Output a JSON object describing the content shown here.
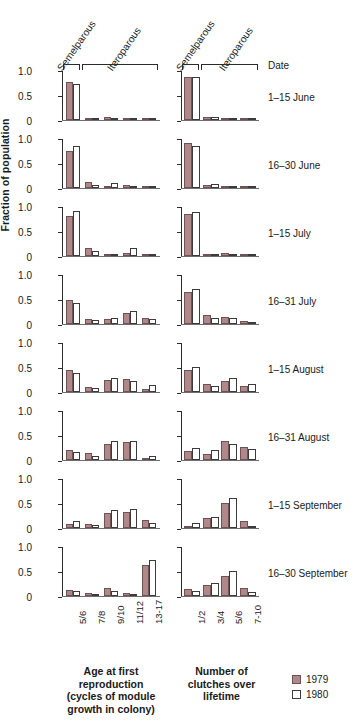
{
  "chart_data": {
    "type": "bar",
    "title": "",
    "ylabel": "Fraction of population",
    "ylim": [
      0,
      1.0
    ],
    "ytick_labels": [
      "1.0",
      "0.5",
      "0"
    ],
    "ytick_values": [
      1.0,
      0.5,
      0
    ],
    "grid": false,
    "legend_position": "bottom-right",
    "legend": [
      {
        "name": "1979",
        "color": "#b0888a",
        "fill": "solid"
      },
      {
        "name": "1980",
        "color": "#ffffff",
        "fill": "open"
      }
    ],
    "series_names": [
      "1979",
      "1980"
    ],
    "row_header_label": "Date",
    "group_brackets": [
      "Semelparous",
      "Iteroparous"
    ],
    "panels": [
      {
        "xlabel": "Age at first reproduction (cycles of module growth in colony)",
        "xlabel_lines": [
          "Age at first",
          "reproduction",
          "(cycles of module",
          "growth in colony)"
        ],
        "categories": [
          "5/6",
          "7/8",
          "9/10",
          "11/12",
          "13-17"
        ],
        "bracket_split": 1
      },
      {
        "xlabel": "Number of clutches over lifetime",
        "xlabel_lines": [
          "Number of",
          "clutches over",
          "lifetime"
        ],
        "categories": [
          "1/2",
          "3/4",
          "5/6",
          "7-10"
        ],
        "bracket_split": 1
      }
    ],
    "rows": [
      {
        "date": "1–15 June",
        "left": {
          "1979": [
            0.76,
            0.05,
            0.06,
            0.05,
            0.02
          ],
          "1980": [
            0.73,
            0.05,
            0.04,
            0.03,
            0.04
          ]
        },
        "right": {
          "1979": [
            0.87,
            0.07,
            0.04,
            0.03
          ],
          "1980": [
            0.87,
            0.06,
            0.03,
            0.02
          ]
        }
      },
      {
        "date": "16–30 June",
        "left": {
          "1979": [
            0.74,
            0.13,
            0.04,
            0.07,
            0.04
          ],
          "1980": [
            0.84,
            0.06,
            0.11,
            0.04,
            0.04
          ]
        },
        "right": {
          "1979": [
            0.9,
            0.06,
            0.05,
            0.0
          ],
          "1980": [
            0.85,
            0.08,
            0.05,
            0.0
          ]
        }
      },
      {
        "date": "1–15 July",
        "left": {
          "1979": [
            0.8,
            0.17,
            0.03,
            0.06,
            0.0
          ],
          "1980": [
            0.9,
            0.11,
            0.04,
            0.16,
            0.0
          ]
        },
        "right": {
          "1979": [
            0.84,
            0.05,
            0.07,
            0.0
          ],
          "1980": [
            0.88,
            0.04,
            0.04,
            0.0
          ]
        }
      },
      {
        "date": "16–31 July",
        "left": {
          "1979": [
            0.49,
            0.1,
            0.11,
            0.23,
            0.13
          ],
          "1980": [
            0.43,
            0.09,
            0.13,
            0.27,
            0.1
          ]
        },
        "right": {
          "1979": [
            0.64,
            0.19,
            0.14,
            0.06
          ],
          "1980": [
            0.7,
            0.13,
            0.13,
            0.05
          ]
        }
      },
      {
        "date": "1–15 August",
        "left": {
          "1979": [
            0.45,
            0.11,
            0.24,
            0.27,
            0.07
          ],
          "1980": [
            0.39,
            0.09,
            0.29,
            0.22,
            0.14
          ]
        },
        "right": {
          "1979": [
            0.44,
            0.17,
            0.22,
            0.12
          ],
          "1980": [
            0.5,
            0.12,
            0.29,
            0.16
          ]
        }
      },
      {
        "date": "16–31 August",
        "left": {
          "1979": [
            0.2,
            0.14,
            0.33,
            0.37,
            0.03
          ],
          "1980": [
            0.16,
            0.08,
            0.38,
            0.39,
            0.09
          ]
        },
        "right": {
          "1979": [
            0.19,
            0.13,
            0.38,
            0.27
          ],
          "1980": [
            0.24,
            0.2,
            0.33,
            0.23
          ]
        }
      },
      {
        "date": "1–15 September",
        "left": {
          "1979": [
            0.09,
            0.08,
            0.3,
            0.33,
            0.16
          ],
          "1980": [
            0.14,
            0.06,
            0.37,
            0.38,
            0.1
          ]
        },
        "right": {
          "1979": [
            0.05,
            0.2,
            0.5,
            0.14
          ],
          "1980": [
            0.11,
            0.22,
            0.61,
            0.04
          ]
        }
      },
      {
        "date": "16–30 September",
        "left": {
          "1979": [
            0.13,
            0.07,
            0.17,
            0.06,
            0.62
          ],
          "1980": [
            0.1,
            0.05,
            0.1,
            0.04,
            0.72
          ]
        },
        "right": {
          "1979": [
            0.14,
            0.23,
            0.41,
            0.17
          ],
          "1980": [
            0.11,
            0.26,
            0.51,
            0.08
          ]
        }
      }
    ]
  }
}
